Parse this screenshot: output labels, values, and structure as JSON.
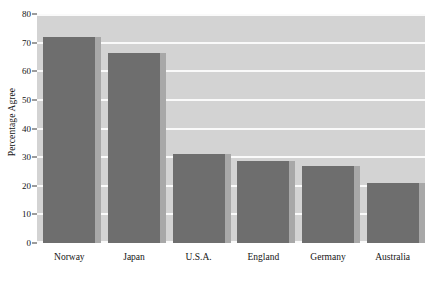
{
  "chart_data": {
    "type": "bar",
    "title": "",
    "xlabel": "",
    "ylabel": "Percentage Agree",
    "categories": [
      "Norway",
      "Japan",
      "U.S.A.",
      "England",
      "Germany",
      "Australia"
    ],
    "values": [
      72,
      66.5,
      31,
      28.5,
      27,
      21
    ],
    "ylim": [
      0,
      80
    ],
    "ytick_labels": [
      "0",
      "10",
      "20",
      "30",
      "40",
      "50",
      "60",
      "70",
      "80"
    ],
    "ytick_values": [
      0,
      10,
      20,
      30,
      40,
      50,
      60,
      70,
      80
    ],
    "grid": true,
    "legend": false,
    "legend_position": "none",
    "colors": {
      "bar_fill": "#6e6e6e",
      "bar_shadow": "#a8a8a8",
      "plot_background": "#d3d3d3",
      "gridline": "#fafafa",
      "page_background": "#ffffff",
      "text": "#141414"
    }
  }
}
